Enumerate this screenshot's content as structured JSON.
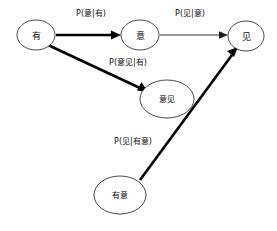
{
  "diagram": {
    "background_color": "#ffffff",
    "stroke_color": "#1a1a1a",
    "thick_edge_color": "#000000",
    "nodes": [
      {
        "id": "you",
        "label": "有",
        "cx": 36,
        "cy": 35,
        "rx": 19,
        "ry": 15
      },
      {
        "id": "yi",
        "label": "意",
        "cx": 140,
        "cy": 35,
        "rx": 19,
        "ry": 15
      },
      {
        "id": "jian",
        "label": "见",
        "cx": 246,
        "cy": 36,
        "rx": 18,
        "ry": 15
      },
      {
        "id": "yijian",
        "label": "意见",
        "cx": 167,
        "cy": 99,
        "rx": 27,
        "ry": 19
      },
      {
        "id": "youyi",
        "label": "有意",
        "cx": 120,
        "cy": 195,
        "rx": 26,
        "ry": 19
      }
    ],
    "edges": [
      {
        "id": "you-to-yi",
        "from": "有",
        "to": "意",
        "label": "P(意|有)",
        "weight": "thick",
        "label_x": 91,
        "label_y": 13
      },
      {
        "id": "yi-to-jian",
        "from": "意",
        "to": "见",
        "label": "P(见|意)",
        "weight": "thin",
        "label_x": 190,
        "label_y": 13
      },
      {
        "id": "you-to-yijian",
        "from": "有",
        "to": "意见",
        "label": "P(意见|有)",
        "weight": "thick",
        "label_x": 128,
        "label_y": 62
      },
      {
        "id": "youyi-to-jian",
        "from": "有意",
        "to": "见",
        "label": "P(见|有意)",
        "weight": "thick",
        "label_x": 133,
        "label_y": 141
      }
    ]
  }
}
